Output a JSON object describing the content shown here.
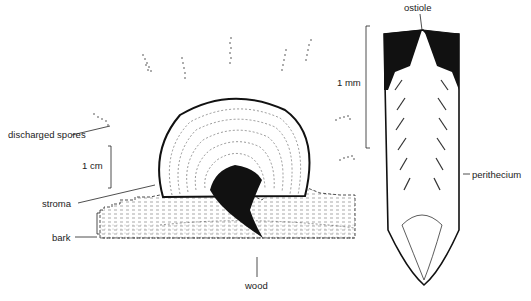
{
  "figure": {
    "left_panel": {
      "description": "Stroma on bark with discharged spores",
      "labels": {
        "discharged_spores": "discharged spores",
        "scale": "1 cm",
        "stroma": "stroma",
        "bark": "bark",
        "wood": "wood"
      }
    },
    "right_panel": {
      "description": "Perithecium section",
      "labels": {
        "ostiole": "ostiole",
        "scale": "1 mm",
        "perithecium": "perithecium"
      }
    },
    "colors": {
      "ink": "#111111",
      "background": "#ffffff"
    }
  }
}
